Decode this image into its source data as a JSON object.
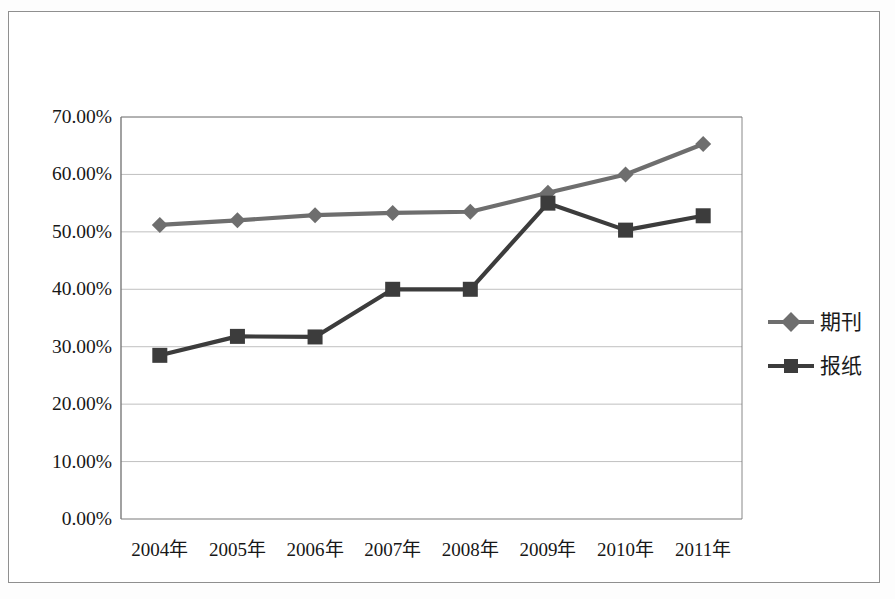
{
  "chart_data": {
    "type": "line",
    "title": "",
    "subtitle": "",
    "xlabel": "",
    "ylabel": "",
    "categories": [
      "2004年",
      "2005年",
      "2006年",
      "2007年",
      "2008年",
      "2009年",
      "2010年",
      "2011年"
    ],
    "ytick_labels": [
      "70.00%",
      "60.00%",
      "50.00%",
      "40.00%",
      "30.00%",
      "20.00%",
      "10.00%",
      "0.00%"
    ],
    "ytick_values": [
      70,
      60,
      50,
      40,
      30,
      20,
      10,
      0
    ],
    "ylim": [
      0,
      70
    ],
    "grid": true,
    "legend_position": "right",
    "series": [
      {
        "name": "期刊",
        "color": "#6e6e6e",
        "marker": "diamond",
        "values": [
          51.2,
          52.0,
          52.9,
          53.3,
          53.5,
          56.8,
          60.0,
          65.3
        ]
      },
      {
        "name": "报纸",
        "color": "#3c3c3c",
        "marker": "square",
        "values": [
          28.5,
          31.8,
          31.7,
          40.0,
          40.0,
          55.0,
          50.3,
          52.8
        ]
      }
    ]
  },
  "style": {
    "grid_color": "#b9b9b9",
    "axis_color": "#7a7a7a",
    "frame_color": "#8f8f8f",
    "background": "#ffffff",
    "text_color": "#171717"
  },
  "plot": {
    "left": 121,
    "right": 742,
    "top": 117,
    "bottom": 519
  }
}
